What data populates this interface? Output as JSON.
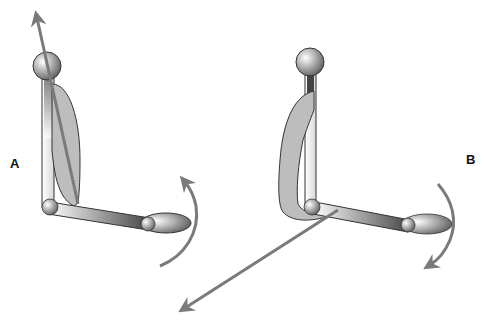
{
  "figure": {
    "panels": [
      {
        "id": "A",
        "label": "A",
        "description": "Elbow flexion: muscle line of action passes along upper arm; forearm rotates upward"
      },
      {
        "id": "B",
        "label": "B",
        "description": "Muscle wraps behind elbow; line of action directed forward-down; forearm rotates downward"
      }
    ]
  },
  "colors": {
    "arrow": "#7a7a7a",
    "muscle_fill": "#bdbdbd",
    "outline": "#333333",
    "bone_light": "#ffffff",
    "bone_dark": "#555555"
  }
}
